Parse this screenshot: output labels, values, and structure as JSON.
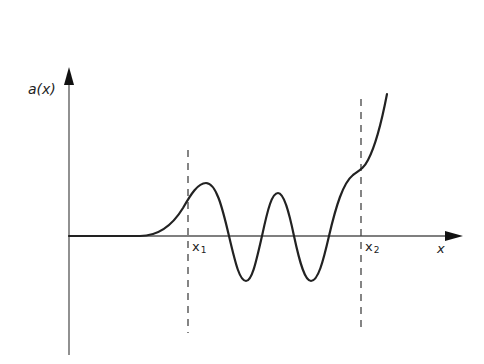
{
  "figure": {
    "y_axis_label": "a(x)",
    "x_axis_label": "x",
    "markers": [
      {
        "name": "x",
        "sub": "1",
        "x_px": 188
      },
      {
        "name": "x",
        "sub": "2",
        "x_px": 360
      }
    ],
    "colors": {
      "curve": "#222222",
      "axis": "#555555",
      "dashed": "#444444",
      "background": "#ffffff"
    }
  }
}
